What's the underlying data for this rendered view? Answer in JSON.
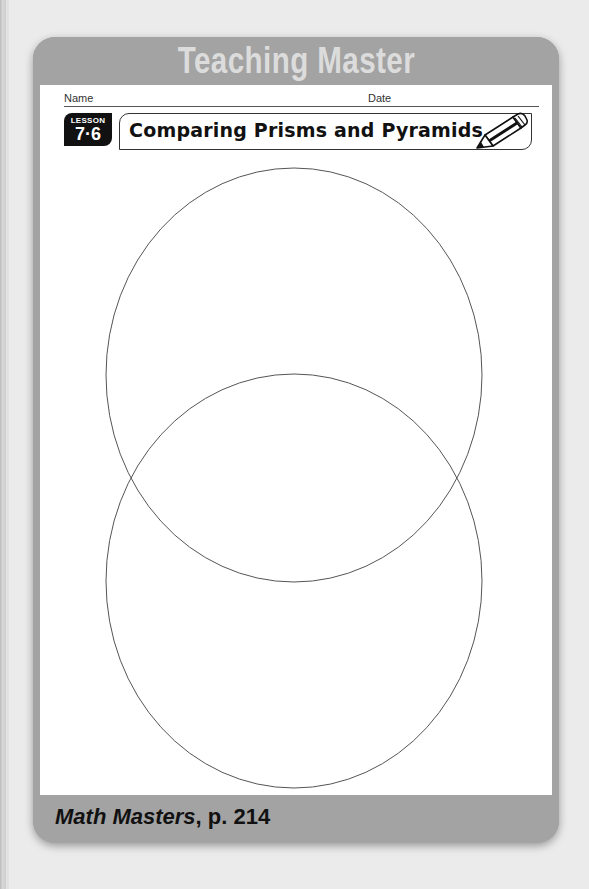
{
  "header": {
    "title": "Teaching Master"
  },
  "worksheet": {
    "name_label": "Name",
    "date_label": "Date",
    "lesson": {
      "word": "LESSON",
      "number": "7·6"
    },
    "title": "Comparing Prisms and Pyramids",
    "title_icon": "pencil-icon",
    "diagram": {
      "type": "venn",
      "circles": 2,
      "labels": []
    }
  },
  "footer": {
    "book": "Math Masters",
    "page_ref": ", p. 214"
  },
  "colors": {
    "frame": "#a3a3a3",
    "header_text": "#dcdcdc",
    "badge": "#111111",
    "page": "#ffffff"
  }
}
